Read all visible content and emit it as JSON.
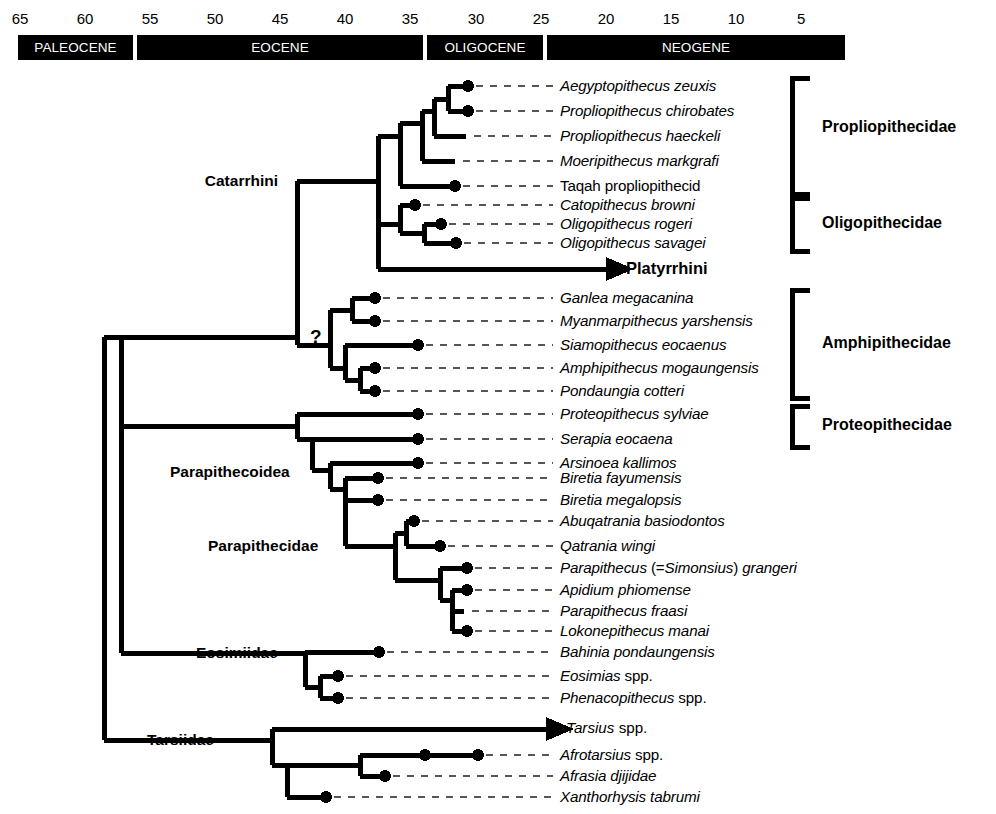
{
  "figure": {
    "type": "phylogenetic-tree-with-timescale",
    "width": 996,
    "height": 814
  },
  "timescale": {
    "ticks": [
      {
        "label": "65",
        "ma": 65,
        "x": 20
      },
      {
        "label": "60",
        "ma": 60,
        "x": 85
      },
      {
        "label": "55",
        "ma": 55,
        "x": 150
      },
      {
        "label": "50",
        "ma": 50,
        "x": 215
      },
      {
        "label": "45",
        "ma": 45,
        "x": 280
      },
      {
        "label": "40",
        "ma": 40,
        "x": 345
      },
      {
        "label": "35",
        "ma": 35,
        "x": 410
      },
      {
        "label": "30",
        "ma": 30,
        "x": 476
      },
      {
        "label": "25",
        "ma": 25,
        "x": 541
      },
      {
        "label": "20",
        "ma": 20,
        "x": 606
      },
      {
        "label": "15",
        "ma": 15,
        "x": 671
      },
      {
        "label": "10",
        "ma": 10,
        "x": 736
      },
      {
        "label": "5",
        "ma": 5,
        "x": 801
      }
    ],
    "epochs": [
      {
        "label": "PALEOCENE",
        "x": 18,
        "width": 115
      },
      {
        "label": "EOCENE",
        "x": 137,
        "width": 286
      },
      {
        "label": "OLIGOCENE",
        "x": 427,
        "width": 116
      },
      {
        "label": "NEOGENE",
        "x": 547,
        "width": 298
      }
    ],
    "bar_color": "#000000",
    "bar_text_color": "#ffffff"
  },
  "taxa": [
    {
      "id": "aegyptopithecus",
      "name": "Aegyptopithecus zeuxis",
      "italic": "Aegyptopithecus zeuxis",
      "roman": "",
      "y": 86,
      "tip_x": 468,
      "dot": true,
      "dash_to": 553
    },
    {
      "id": "propliopithecus-chirobates",
      "name": "Propliopithecus chirobates",
      "italic": "Propliopithecus chirobates",
      "roman": "",
      "y": 111,
      "tip_x": 468,
      "dot": true,
      "dash_to": 553
    },
    {
      "id": "propliopithecus-haeckeli",
      "name": "Propliopithecus haeckeli",
      "italic": "Propliopithecus haeckeli",
      "roman": "",
      "y": 136,
      "tip_x": 466,
      "dot": false,
      "dash_to": 553
    },
    {
      "id": "moeripithecus-markgrafi",
      "name": "Moeripithecus markgrafi",
      "italic": "Moeripithecus markgrafi",
      "roman": "",
      "y": 161,
      "tip_x": 455,
      "dot": false,
      "dash_to": 553
    },
    {
      "id": "taqah-propliopithecid",
      "name": "Taqah propliopithecid",
      "italic": "",
      "roman": "Taqah propliopithecid",
      "y": 186,
      "tip_x": 455,
      "dot": true,
      "dash_to": 553
    },
    {
      "id": "catopithecus-browni",
      "name": "Catopithecus browni",
      "italic": "Catopithecus browni",
      "roman": "",
      "y": 205,
      "tip_x": 415,
      "dot": true,
      "dash_to": 553
    },
    {
      "id": "oligopithecus-rogeri",
      "name": "Oligopithecus rogeri",
      "italic": "Oligopithecus rogeri",
      "roman": "",
      "y": 224,
      "tip_x": 441,
      "dot": true,
      "dash_to": 553
    },
    {
      "id": "oligopithecus-savagei",
      "name": "Oligopithecus savagei",
      "italic": "Oligopithecus savagei",
      "roman": "",
      "y": 243,
      "tip_x": 456,
      "dot": true,
      "dash_to": 553
    },
    {
      "id": "ganlea-megacanina",
      "name": "Ganlea megacanina",
      "italic": "Ganlea megacanina",
      "roman": "",
      "y": 298,
      "tip_x": 375,
      "dot": true,
      "dash_to": 553
    },
    {
      "id": "myanmarpithecus-yarshensis",
      "name": "Myanmarpithecus yarshensis",
      "italic": "Myanmarpithecus yarshensis",
      "roman": "",
      "y": 321,
      "tip_x": 375,
      "dot": true,
      "dash_to": 553
    },
    {
      "id": "siamopithecus-eocaenus",
      "name": "Siamopithecus eocaenus",
      "italic": "Siamopithecus eocaenus",
      "roman": "",
      "y": 345,
      "tip_x": 418,
      "dot": true,
      "dash_to": 553
    },
    {
      "id": "amphipithecus-mogaungensis",
      "name": "Amphipithecus mogaungensis",
      "italic": "Amphipithecus mogaungensis",
      "roman": "",
      "y": 368,
      "tip_x": 375,
      "dot": true,
      "dash_to": 553
    },
    {
      "id": "pondaungia-cotteri",
      "name": "Pondaungia cotteri",
      "italic": "Pondaungia cotteri",
      "roman": "",
      "y": 391,
      "tip_x": 375,
      "dot": true,
      "dash_to": 553
    },
    {
      "id": "proteopithecus-sylviae",
      "name": "Proteopithecus sylviae",
      "italic": "Proteopithecus sylviae",
      "roman": "",
      "y": 414,
      "tip_x": 418,
      "dot": true,
      "dash_to": 553
    },
    {
      "id": "serapia-eocaena",
      "name": "Serapia eocaena",
      "italic": "Serapia eocaena",
      "roman": "",
      "y": 439,
      "tip_x": 418,
      "dot": true,
      "dash_to": 553
    },
    {
      "id": "arsinoea-kallimos",
      "name": "Arsinoea kallimos",
      "italic": "Arsinoea kallimos",
      "roman": "",
      "y": 463,
      "tip_x": 418,
      "dot": true,
      "dash_to": 553
    },
    {
      "id": "biretia-fayumensis",
      "name": "Biretia fayumensis",
      "italic": "Biretia fayumensis",
      "roman": "",
      "y": 478,
      "tip_x": 378,
      "dot": true,
      "dash_to": 553
    },
    {
      "id": "biretia-megalopsis",
      "name": "Biretia megalopsis",
      "italic": "Biretia megalopsis",
      "roman": "",
      "y": 500,
      "tip_x": 378,
      "dot": true,
      "dash_to": 553
    },
    {
      "id": "abuqatrania-basiodontos",
      "name": "Abuqatrania basiodontos",
      "italic": "Abuqatrania basiodontos",
      "roman": "",
      "y": 521,
      "tip_x": 414,
      "dot": true,
      "dash_to": 553
    },
    {
      "id": "qatrania-wingi",
      "name": "Qatrania wingi",
      "italic": "Qatrania wingi",
      "roman": "",
      "y": 546,
      "tip_x": 440,
      "dot": true,
      "dash_to": 553
    },
    {
      "id": "parapithecus-grangeri",
      "name": "Parapithecus (=Simonsius) grangeri",
      "italic": "",
      "roman": "",
      "y": 568,
      "tip_x": 467,
      "dot": true,
      "dash_to": 553
    },
    {
      "id": "apidium-phiomense",
      "name": "Apidium phiomense",
      "italic": "Apidium phiomense",
      "roman": "",
      "y": 590,
      "tip_x": 467,
      "dot": true,
      "dash_to": 553
    },
    {
      "id": "parapithecus-fraasi",
      "name": "Parapithecus fraasi",
      "italic": "Parapithecus fraasi",
      "roman": "",
      "y": 611,
      "tip_x": 464,
      "dot": false,
      "dash_to": 553
    },
    {
      "id": "lokonepithecus-manai",
      "name": "Lokonepithecus manai",
      "italic": "Lokonepithecus manai",
      "roman": "",
      "y": 631,
      "tip_x": 467,
      "dot": true,
      "dash_to": 553
    },
    {
      "id": "bahinia-pondaungensis",
      "name": "Bahinia pondaungensis",
      "italic": "Bahinia pondaungensis",
      "roman": "",
      "y": 652,
      "tip_x": 379,
      "dot": true,
      "dash_to": 553
    },
    {
      "id": "eosimias-spp",
      "name": "Eosimias spp.",
      "italic": "Eosimias ",
      "roman": "spp.",
      "y": 676,
      "tip_x": 338,
      "dot": true,
      "dash_to": 553
    },
    {
      "id": "phenacopithecus-spp",
      "name": "Phenacopithecus spp.",
      "italic": "Phenacopithecus ",
      "roman": "spp.",
      "y": 698,
      "tip_x": 338,
      "dot": true,
      "dash_to": 553
    },
    {
      "id": "afrotarsius-spp",
      "name": "Afrotarsius spp.",
      "italic": "Afrotarsius ",
      "roman": "spp.",
      "y": 755,
      "tip_x": 478,
      "dot": true,
      "dash_to": 553
    },
    {
      "id": "afrasia-djijidae",
      "name": "Afrasia djijidae",
      "italic": "Afrasia djijidae",
      "roman": "",
      "y": 776,
      "tip_x": 385,
      "dot": true,
      "dash_to": 553
    },
    {
      "id": "xanthorhysis-tabrumi",
      "name": "Xanthorhysis tabrumi",
      "italic": "Xanthorhysis tabrumi",
      "roman": "",
      "y": 797,
      "tip_x": 326,
      "dot": true,
      "dash_to": 553
    }
  ],
  "parapithecus_grangeri_parts": {
    "p1": "Parapithecus",
    "p2": " (=",
    "p3": "Simonsius",
    "p4": ") ",
    "p5": "grangeri"
  },
  "arrow_taxa": [
    {
      "id": "platyrrhini",
      "label": "Platyrrhini",
      "y": 269,
      "bold": true,
      "italic": false,
      "label_x": 626,
      "arrow_from": 379,
      "arrow_to": 618
    },
    {
      "id": "tarsius-spp",
      "label": "Tarsius spp.",
      "italic_part": "Tarsius ",
      "roman_part": "spp.",
      "y": 729,
      "bold": false,
      "italic": true,
      "label_x": 566,
      "arrow_from": 272,
      "arrow_to": 558
    }
  ],
  "clade_labels": [
    {
      "id": "catarrhini",
      "label": "Catarrhini",
      "x": 278,
      "y": 181,
      "anchor": "end"
    },
    {
      "id": "parapithecoidea",
      "label": "Parapithecoidea",
      "x": 170,
      "y": 472,
      "anchor": "start"
    },
    {
      "id": "parapithecidae",
      "label": "Parapithecidae",
      "x": 208,
      "y": 546,
      "anchor": "start"
    },
    {
      "id": "eosimiidae",
      "label": "Eosimiidae",
      "x": 196,
      "y": 653,
      "anchor": "start"
    },
    {
      "id": "tarsiidae",
      "label": "Tarsiidae",
      "x": 147,
      "y": 740,
      "anchor": "start"
    }
  ],
  "question_mark": {
    "label": "?",
    "x": 310,
    "y": 337
  },
  "family_brackets": [
    {
      "id": "propliopithecidae",
      "label": "Propliopithecidae",
      "top": 78,
      "bottom": 194,
      "x": 792,
      "label_x": 822,
      "label_y": 128
    },
    {
      "id": "oligopithecidae",
      "label": "Oligopithecidae",
      "top": 198,
      "bottom": 251,
      "x": 792,
      "label_x": 822,
      "label_y": 224
    },
    {
      "id": "amphipithecidae",
      "label": "Amphipithecidae",
      "top": 290,
      "bottom": 398,
      "x": 792,
      "label_x": 822,
      "label_y": 344
    },
    {
      "id": "proteopithecidae",
      "label": "Proteopithecidae",
      "top": 406,
      "bottom": 447,
      "x": 792,
      "label_x": 822,
      "label_y": 426
    }
  ],
  "colors": {
    "line": "#000000",
    "bar_fill": "#000000",
    "bar_label": "#ffffff",
    "background": "#ffffff",
    "dash": "#4a4a4a"
  }
}
